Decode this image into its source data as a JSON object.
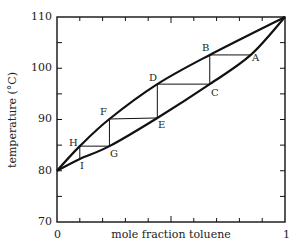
{
  "chart_data": {
    "type": "line",
    "title": "",
    "xlabel": "mole fraction toluene",
    "ylabel": "temperature (°C)",
    "xlim": [
      0,
      1
    ],
    "ylim": [
      70,
      110
    ],
    "x_tick_labels": [
      "0",
      "1"
    ],
    "x_minor_ticks": [
      0.1,
      0.2,
      0.3,
      0.4,
      0.5,
      0.6,
      0.7,
      0.8,
      0.9
    ],
    "y_tick_labels": [
      "70",
      "80",
      "90",
      "100",
      "110"
    ],
    "y_ticks": [
      70,
      75,
      80,
      85,
      90,
      95,
      100,
      105,
      110
    ],
    "grid": false,
    "legend": null,
    "series": [
      {
        "name": "vapor curve (upper)",
        "x": [
          0,
          0.1,
          0.23,
          0.44,
          0.67,
          1.0
        ],
        "y": [
          80,
          84.8,
          90.1,
          96.9,
          102.6,
          110
        ]
      },
      {
        "name": "liquid curve (lower)",
        "x": [
          0,
          0.1,
          0.23,
          0.44,
          0.67,
          0.85,
          1.0
        ],
        "y": [
          80,
          82.3,
          84.8,
          90.3,
          96.9,
          102.6,
          110
        ]
      }
    ],
    "points": [
      {
        "label": "A",
        "x": 0.85,
        "y": 102.6
      },
      {
        "label": "B",
        "x": 0.67,
        "y": 102.6
      },
      {
        "label": "C",
        "x": 0.67,
        "y": 96.9
      },
      {
        "label": "D",
        "x": 0.44,
        "y": 96.9
      },
      {
        "label": "E",
        "x": 0.44,
        "y": 90.3
      },
      {
        "label": "F",
        "x": 0.23,
        "y": 90.1
      },
      {
        "label": "G",
        "x": 0.23,
        "y": 84.8
      },
      {
        "label": "H",
        "x": 0.1,
        "y": 84.8
      },
      {
        "label": "I",
        "x": 0.1,
        "y": 82.3
      }
    ],
    "steps": [
      [
        "A",
        "B"
      ],
      [
        "B",
        "C"
      ],
      [
        "C",
        "D"
      ],
      [
        "D",
        "E"
      ],
      [
        "E",
        "F"
      ],
      [
        "F",
        "G"
      ],
      [
        "G",
        "H"
      ],
      [
        "H",
        "I"
      ]
    ]
  },
  "labels": {
    "y": [
      "110",
      "100",
      "90",
      "80",
      "70"
    ],
    "x0": "0",
    "x1": "1",
    "xlabel": "mole fraction toluene",
    "ylabel": "temperature (°C)",
    "points": {
      "A": "A",
      "B": "B",
      "C": "C",
      "D": "D",
      "E": "E",
      "F": "F",
      "G": "G",
      "H": "H",
      "I": "I"
    }
  }
}
